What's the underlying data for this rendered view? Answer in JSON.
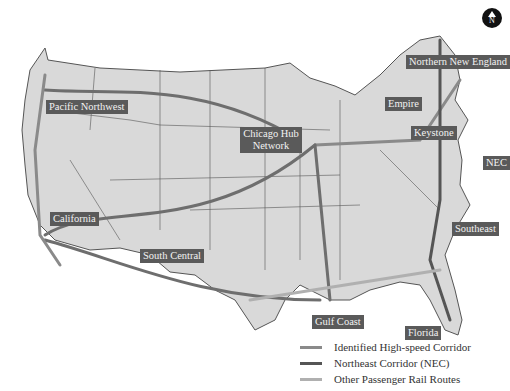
{
  "map": {
    "compass": {
      "letter": "N"
    },
    "regions": [
      {
        "id": "pacific-northwest",
        "label": "Pacific Northwest"
      },
      {
        "id": "california",
        "label": "California"
      },
      {
        "id": "south-central",
        "label": "South Central"
      },
      {
        "id": "chicago-hub",
        "label": "Chicago Hub Network"
      },
      {
        "id": "empire",
        "label": "Empire"
      },
      {
        "id": "northern-new-england",
        "label": "Northern New England"
      },
      {
        "id": "keystone",
        "label": "Keystone"
      },
      {
        "id": "nec",
        "label": "NEC"
      },
      {
        "id": "southeast",
        "label": "Southeast"
      },
      {
        "id": "gulf-coast",
        "label": "Gulf Coast"
      },
      {
        "id": "florida",
        "label": "Florida"
      }
    ],
    "legend": [
      {
        "label": "Identified High-speed Corridor",
        "color": "#8a8a8a"
      },
      {
        "label": "Northeast Corridor (NEC)",
        "color": "#555555"
      },
      {
        "label": "Other Passenger Rail Routes",
        "color": "#b0b0b0"
      }
    ],
    "colors": {
      "land": "#d9d9d9",
      "border": "#555555",
      "corridor": "#6e6e6e",
      "label_bg": "#5a5a5a"
    }
  }
}
